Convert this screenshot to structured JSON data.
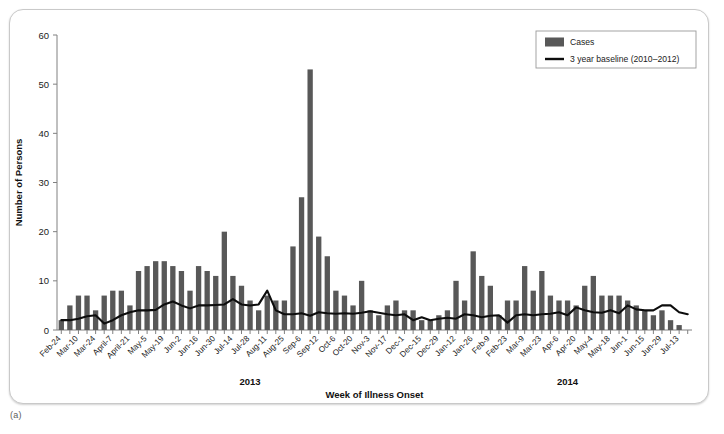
{
  "figure": {
    "panel_label": "(a)"
  },
  "legend": {
    "position": "top-right",
    "items": [
      {
        "label": "Cases",
        "type": "bar",
        "color": "#585858"
      },
      {
        "label": "3 year baseline (2010–2012)",
        "type": "line",
        "color": "#0d0d0d"
      }
    ]
  },
  "chart_data": {
    "type": "bar",
    "title": "",
    "xlabel": "Week of Illness Onset",
    "ylabel": "Number of Persons",
    "ylim": [
      0,
      60
    ],
    "yticks": [
      0,
      10,
      20,
      30,
      40,
      50,
      60
    ],
    "grid": false,
    "legend_position": "top-right",
    "year_groups": [
      {
        "label": "2013",
        "start_index": 0,
        "end_index": 44
      },
      {
        "label": "2014",
        "start_index": 45,
        "end_index": 73
      }
    ],
    "categories": [
      "Feb-24",
      "Mar-3",
      "Mar-10",
      "Mar-17",
      "Mar-24",
      "Mar-31",
      "April-7",
      "April-14",
      "April-21",
      "April-28",
      "May-5",
      "May-12",
      "May-19",
      "May-26",
      "Jun-2",
      "Jun-9",
      "Jun-16",
      "Jun-23",
      "Jun-30",
      "Jul-7",
      "Jul-14",
      "Jul-21",
      "Jul-28",
      "Aug-4",
      "Aug-11",
      "Aug-18",
      "Aug-25",
      "Sep-1",
      "Sep-6",
      "Sep-9",
      "Sep-12",
      "Sep-29",
      "Oct-6",
      "Oct-13",
      "Oct-20",
      "Oct-27",
      "Nov-3",
      "Nov-10",
      "Nov-17",
      "Nov-24",
      "Dec-1",
      "Dec-8",
      "Dec-15",
      "Dec-22",
      "Dec-29",
      "Jan-5",
      "Jan-12",
      "Jan-19",
      "Jan-26",
      "Feb-2",
      "Feb-9",
      "Feb-16",
      "Feb-23",
      "Mar-2",
      "Mar-9",
      "Mar-16",
      "Mar-23",
      "Mar-30",
      "Apr-6",
      "Apr-13",
      "Apr-20",
      "Apr-27",
      "May-4",
      "May-11",
      "May-18",
      "May-25",
      "Jun-1",
      "Jun-8",
      "Jun-15",
      "Jun-22",
      "Jun-29",
      "Jul-6",
      "Jul-13",
      "Jul-20"
    ],
    "xtick_labels": [
      "Feb-24",
      "Mar-10",
      "Mar-24",
      "April-7",
      "April-21",
      "May-5",
      "May-19",
      "Jun-2",
      "Jun-16",
      "Jun-30",
      "Jul-14",
      "Jul-28",
      "Aug-11",
      "Aug-25",
      "Sep-6",
      "Sep-12",
      "Oct-6",
      "Oct-20",
      "Nov-3",
      "Nov-17",
      "Dec-1",
      "Dec-15",
      "Dec-29",
      "Jan-12",
      "Jan-26",
      "Feb-9",
      "Feb-23",
      "Mar-9",
      "Mar-23",
      "Apr-6",
      "Apr-20",
      "May-4",
      "May-18",
      "Jun-1",
      "Jun-15",
      "Jun-29",
      "Jul-13"
    ],
    "xtick_indices": [
      0,
      2,
      4,
      6,
      8,
      10,
      12,
      14,
      16,
      18,
      20,
      22,
      24,
      26,
      28,
      30,
      32,
      34,
      36,
      38,
      40,
      42,
      44,
      46,
      48,
      50,
      52,
      54,
      56,
      58,
      60,
      62,
      64,
      66,
      68,
      70,
      72
    ],
    "series": [
      {
        "name": "Cases",
        "type": "bar",
        "color": "#585858",
        "values": [
          2,
          5,
          7,
          7,
          4,
          7,
          8,
          8,
          5,
          12,
          13,
          14,
          14,
          13,
          12,
          8,
          13,
          12,
          11,
          20,
          11,
          9,
          6,
          4,
          7,
          6,
          6,
          17,
          27,
          53,
          19,
          15,
          8,
          7,
          5,
          10,
          4,
          3,
          5,
          6,
          4,
          4,
          2,
          2,
          3,
          4,
          10,
          6,
          16,
          11,
          9,
          3,
          6,
          6,
          13,
          8,
          12,
          7,
          6,
          6,
          5,
          9,
          11,
          7,
          7,
          7,
          6,
          5,
          4,
          3,
          4,
          2,
          1,
          0
        ]
      },
      {
        "name": "3 year baseline (2010–2012)",
        "type": "line",
        "color": "#0d0d0d",
        "values": [
          2.0,
          2.0,
          2.3,
          2.8,
          3.0,
          1.3,
          2.0,
          3.0,
          3.6,
          4.0,
          4.0,
          4.1,
          5.2,
          5.8,
          5.0,
          4.4,
          5.0,
          5.0,
          5.1,
          5.2,
          6.3,
          5.2,
          5.0,
          5.2,
          8.0,
          4.0,
          3.2,
          3.2,
          3.4,
          2.9,
          3.6,
          3.4,
          3.3,
          3.4,
          3.3,
          3.5,
          3.8,
          3.5,
          3.2,
          3.0,
          3.2,
          2.0,
          2.6,
          2.0,
          2.3,
          2.5,
          2.3,
          3.2,
          3.0,
          2.6,
          2.9,
          3.0,
          1.5,
          3.0,
          3.2,
          3.0,
          3.2,
          3.3,
          3.6,
          3.0,
          4.6,
          4.0,
          3.6,
          3.5,
          4.0,
          3.4,
          5.0,
          4.2,
          4.0,
          4.0,
          5.0,
          5.0,
          3.6,
          3.2
        ]
      }
    ]
  }
}
